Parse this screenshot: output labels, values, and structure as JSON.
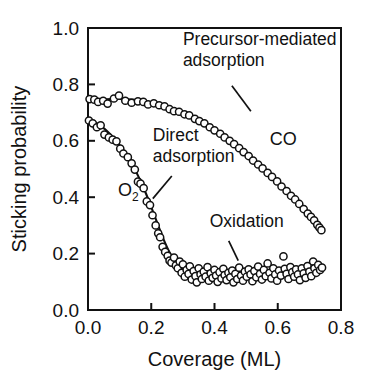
{
  "chart_data": {
    "type": "scatter",
    "title": "",
    "xlabel": "Coverage (ML)",
    "ylabel": "Sticking probability",
    "xlim": [
      0.0,
      0.8
    ],
    "ylim": [
      0.0,
      1.0
    ],
    "xticks": [
      "0.0",
      "0.2",
      "0.4",
      "0.6",
      "0.8"
    ],
    "xtick_values": [
      0.0,
      0.2,
      0.4,
      0.6,
      0.8
    ],
    "yticks": [
      "0.0",
      "0.2",
      "0.4",
      "0.6",
      "0.8",
      "1.0"
    ],
    "ytick_values": [
      0.0,
      0.2,
      0.4,
      0.6,
      0.8,
      1.0
    ],
    "grid": false,
    "legend_position": "none",
    "marker_style": "open-circle",
    "annotations": [
      {
        "id": "precursor-mediated-adsorption",
        "text_line1": "Precursor-mediated",
        "text_line2": "adsorption",
        "x": 0.3,
        "y": 0.94,
        "leader_from": [
          0.455,
          0.795
        ],
        "leader_to": [
          0.515,
          0.705
        ]
      },
      {
        "id": "direct-adsorption",
        "text_line1": "Direct",
        "text_line2": "adsorption",
        "x": 0.205,
        "y": 0.6,
        "leader_from": [
          0.265,
          0.475
        ],
        "leader_to": [
          0.205,
          0.395
        ]
      },
      {
        "id": "oxidation",
        "text_line1": "Oxidation",
        "text_line2": "",
        "x": 0.385,
        "y": 0.295,
        "leader_from": [
          0.445,
          0.245
        ],
        "leader_to": [
          0.475,
          0.175
        ]
      }
    ],
    "series_labels": [
      {
        "id": "co-label",
        "text": "CO",
        "x": 0.575,
        "y": 0.585
      },
      {
        "id": "o2-label",
        "text": "O",
        "subscript": "2",
        "x": 0.095,
        "y": 0.405
      }
    ],
    "series": [
      {
        "name": "CO",
        "label": "CO",
        "mechanism": "Precursor-mediated adsorption",
        "fit_curve": [
          [
            0.0,
            0.745
          ],
          [
            0.025,
            0.746
          ],
          [
            0.05,
            0.747
          ],
          [
            0.075,
            0.748
          ],
          [
            0.1,
            0.748
          ],
          [
            0.125,
            0.747
          ],
          [
            0.15,
            0.745
          ],
          [
            0.175,
            0.741
          ],
          [
            0.2,
            0.735
          ],
          [
            0.225,
            0.727
          ],
          [
            0.25,
            0.718
          ],
          [
            0.275,
            0.708
          ],
          [
            0.3,
            0.697
          ],
          [
            0.325,
            0.684
          ],
          [
            0.35,
            0.67
          ],
          [
            0.375,
            0.654
          ],
          [
            0.4,
            0.637
          ],
          [
            0.425,
            0.618
          ],
          [
            0.45,
            0.598
          ],
          [
            0.475,
            0.577
          ],
          [
            0.5,
            0.554
          ],
          [
            0.525,
            0.53
          ],
          [
            0.55,
            0.505
          ],
          [
            0.575,
            0.479
          ],
          [
            0.6,
            0.452
          ],
          [
            0.625,
            0.424
          ],
          [
            0.65,
            0.396
          ],
          [
            0.675,
            0.367
          ],
          [
            0.7,
            0.337
          ],
          [
            0.72,
            0.31
          ],
          [
            0.735,
            0.285
          ]
        ],
        "points": [
          [
            0.005,
            0.748
          ],
          [
            0.02,
            0.746
          ],
          [
            0.032,
            0.738
          ],
          [
            0.048,
            0.742
          ],
          [
            0.062,
            0.732
          ],
          [
            0.082,
            0.75
          ],
          [
            0.098,
            0.76
          ],
          [
            0.118,
            0.742
          ],
          [
            0.138,
            0.735
          ],
          [
            0.158,
            0.74
          ],
          [
            0.175,
            0.738
          ],
          [
            0.19,
            0.729
          ],
          [
            0.208,
            0.733
          ],
          [
            0.225,
            0.726
          ],
          [
            0.242,
            0.722
          ],
          [
            0.258,
            0.712
          ],
          [
            0.272,
            0.705
          ],
          [
            0.288,
            0.703
          ],
          [
            0.305,
            0.694
          ],
          [
            0.32,
            0.69
          ],
          [
            0.338,
            0.678
          ],
          [
            0.352,
            0.67
          ],
          [
            0.368,
            0.662
          ],
          [
            0.385,
            0.648
          ],
          [
            0.4,
            0.637
          ],
          [
            0.418,
            0.625
          ],
          [
            0.432,
            0.612
          ],
          [
            0.448,
            0.6
          ],
          [
            0.462,
            0.588
          ],
          [
            0.478,
            0.574
          ],
          [
            0.492,
            0.56
          ],
          [
            0.508,
            0.546
          ],
          [
            0.522,
            0.53
          ],
          [
            0.538,
            0.516
          ],
          [
            0.552,
            0.502
          ],
          [
            0.568,
            0.486
          ],
          [
            0.582,
            0.472
          ],
          [
            0.598,
            0.456
          ],
          [
            0.612,
            0.438
          ],
          [
            0.628,
            0.422
          ],
          [
            0.642,
            0.405
          ],
          [
            0.655,
            0.392
          ],
          [
            0.668,
            0.376
          ],
          [
            0.682,
            0.358
          ],
          [
            0.695,
            0.342
          ],
          [
            0.705,
            0.33
          ],
          [
            0.715,
            0.318
          ],
          [
            0.725,
            0.302
          ],
          [
            0.732,
            0.292
          ],
          [
            0.738,
            0.283
          ]
        ]
      },
      {
        "name": "O2",
        "label": "O₂",
        "mechanism": "Direct adsorption then Oxidation plateau",
        "fit_curve": [
          [
            0.0,
            0.68
          ],
          [
            0.02,
            0.668
          ],
          [
            0.04,
            0.653
          ],
          [
            0.06,
            0.635
          ],
          [
            0.08,
            0.612
          ],
          [
            0.1,
            0.585
          ],
          [
            0.12,
            0.553
          ],
          [
            0.14,
            0.516
          ],
          [
            0.16,
            0.472
          ],
          [
            0.18,
            0.422
          ],
          [
            0.2,
            0.365
          ],
          [
            0.22,
            0.305
          ],
          [
            0.24,
            0.248
          ],
          [
            0.26,
            0.2
          ],
          [
            0.28,
            0.166
          ],
          [
            0.3,
            0.145
          ],
          [
            0.32,
            0.134
          ],
          [
            0.34,
            0.128
          ],
          [
            0.36,
            0.124
          ],
          [
            0.38,
            0.121
          ],
          [
            0.4,
            0.119
          ],
          [
            0.42,
            0.118
          ],
          [
            0.44,
            0.118
          ],
          [
            0.46,
            0.119
          ],
          [
            0.48,
            0.121
          ],
          [
            0.5,
            0.124
          ],
          [
            0.52,
            0.128
          ],
          [
            0.54,
            0.132
          ],
          [
            0.56,
            0.136
          ],
          [
            0.58,
            0.139
          ],
          [
            0.6,
            0.142
          ],
          [
            0.62,
            0.144
          ],
          [
            0.64,
            0.145
          ],
          [
            0.66,
            0.146
          ],
          [
            0.68,
            0.147
          ],
          [
            0.7,
            0.147
          ],
          [
            0.72,
            0.147
          ],
          [
            0.745,
            0.147
          ]
        ],
        "points": [
          [
            0.003,
            0.672
          ],
          [
            0.015,
            0.662
          ],
          [
            0.028,
            0.648
          ],
          [
            0.04,
            0.655
          ],
          [
            0.052,
            0.622
          ],
          [
            0.066,
            0.612
          ],
          [
            0.078,
            0.604
          ],
          [
            0.09,
            0.598
          ],
          [
            0.102,
            0.572
          ],
          [
            0.112,
            0.555
          ],
          [
            0.126,
            0.542
          ],
          [
            0.138,
            0.52
          ],
          [
            0.148,
            0.498
          ],
          [
            0.158,
            0.455
          ],
          [
            0.166,
            0.448
          ],
          [
            0.176,
            0.432
          ],
          [
            0.186,
            0.385
          ],
          [
            0.196,
            0.372
          ],
          [
            0.204,
            0.336
          ],
          [
            0.214,
            0.3
          ],
          [
            0.222,
            0.272
          ],
          [
            0.228,
            0.258
          ],
          [
            0.236,
            0.224
          ],
          [
            0.244,
            0.206
          ],
          [
            0.252,
            0.192
          ],
          [
            0.258,
            0.175
          ],
          [
            0.264,
            0.168
          ],
          [
            0.272,
            0.186
          ],
          [
            0.278,
            0.158
          ],
          [
            0.284,
            0.148
          ],
          [
            0.29,
            0.172
          ],
          [
            0.296,
            0.132
          ],
          [
            0.3,
            0.162
          ],
          [
            0.306,
            0.118
          ],
          [
            0.312,
            0.142
          ],
          [
            0.318,
            0.128
          ],
          [
            0.322,
            0.155
          ],
          [
            0.328,
            0.108
          ],
          [
            0.334,
            0.138
          ],
          [
            0.34,
            0.12
          ],
          [
            0.344,
            0.098
          ],
          [
            0.35,
            0.148
          ],
          [
            0.356,
            0.126
          ],
          [
            0.36,
            0.11
          ],
          [
            0.366,
            0.136
          ],
          [
            0.372,
            0.118
          ],
          [
            0.378,
            0.152
          ],
          [
            0.382,
            0.104
          ],
          [
            0.388,
            0.13
          ],
          [
            0.394,
            0.114
          ],
          [
            0.4,
            0.142
          ],
          [
            0.405,
            0.122
          ],
          [
            0.41,
            0.1
          ],
          [
            0.416,
            0.134
          ],
          [
            0.422,
            0.112
          ],
          [
            0.428,
            0.146
          ],
          [
            0.432,
            0.124
          ],
          [
            0.438,
            0.106
          ],
          [
            0.444,
            0.132
          ],
          [
            0.45,
            0.116
          ],
          [
            0.456,
            0.14
          ],
          [
            0.46,
            0.098
          ],
          [
            0.466,
            0.128
          ],
          [
            0.472,
            0.11
          ],
          [
            0.478,
            0.15
          ],
          [
            0.484,
            0.122
          ],
          [
            0.49,
            0.104
          ],
          [
            0.496,
            0.136
          ],
          [
            0.502,
            0.118
          ],
          [
            0.508,
            0.144
          ],
          [
            0.514,
            0.126
          ],
          [
            0.52,
            0.102
          ],
          [
            0.526,
            0.138
          ],
          [
            0.532,
            0.116
          ],
          [
            0.538,
            0.154
          ],
          [
            0.544,
            0.128
          ],
          [
            0.55,
            0.108
          ],
          [
            0.556,
            0.142
          ],
          [
            0.562,
            0.12
          ],
          [
            0.568,
            0.165
          ],
          [
            0.574,
            0.132
          ],
          [
            0.58,
            0.112
          ],
          [
            0.586,
            0.148
          ],
          [
            0.592,
            0.126
          ],
          [
            0.598,
            0.104
          ],
          [
            0.604,
            0.14
          ],
          [
            0.61,
            0.122
          ],
          [
            0.618,
            0.19
          ],
          [
            0.622,
            0.146
          ],
          [
            0.628,
            0.128
          ],
          [
            0.634,
            0.11
          ],
          [
            0.64,
            0.152
          ],
          [
            0.646,
            0.134
          ],
          [
            0.652,
            0.118
          ],
          [
            0.658,
            0.144
          ],
          [
            0.664,
            0.126
          ],
          [
            0.67,
            0.106
          ],
          [
            0.676,
            0.148
          ],
          [
            0.682,
            0.13
          ],
          [
            0.688,
            0.114
          ],
          [
            0.694,
            0.156
          ],
          [
            0.7,
            0.136
          ],
          [
            0.706,
            0.12
          ],
          [
            0.712,
            0.172
          ],
          [
            0.716,
            0.148
          ],
          [
            0.722,
            0.132
          ],
          [
            0.728,
            0.16
          ],
          [
            0.734,
            0.142
          ],
          [
            0.74,
            0.15
          ]
        ]
      }
    ]
  }
}
